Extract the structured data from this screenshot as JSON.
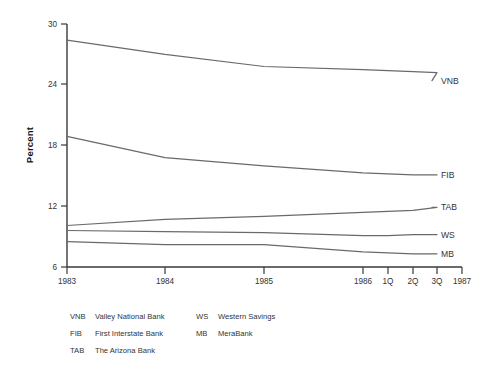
{
  "chart_data": {
    "type": "line",
    "title": "",
    "xlabel": "",
    "ylabel": "Percent",
    "ylim": [
      6,
      30
    ],
    "yticks": [
      6,
      12,
      18,
      24,
      30
    ],
    "ytick_labels": [
      "6",
      "12",
      "18",
      "24",
      "30"
    ],
    "xtick_labels": [
      "1983",
      "1984",
      "1985",
      "1986",
      "1Q",
      "2Q",
      "3Q",
      "1987"
    ],
    "x": [
      "1983",
      "1984",
      "1985",
      "1986",
      "1Q",
      "2Q",
      "3Q"
    ],
    "grid": false,
    "legend_position": "right-of-axes-endpoint",
    "series": [
      {
        "name": "VNB",
        "label": "VNB",
        "full_name": "Valley National Bank",
        "values": [
          28.4,
          27.0,
          25.8,
          25.5,
          25.4,
          25.3,
          25.2
        ],
        "end_value": 24.4,
        "color": "#6a6a6a"
      },
      {
        "name": "FIB",
        "label": "FIB",
        "full_name": "First Interstate Bank",
        "values": [
          18.9,
          16.8,
          16.0,
          15.3,
          15.2,
          15.1,
          15.1
        ],
        "end_value": 15.1,
        "color": "#6a6a6a"
      },
      {
        "name": "TAB",
        "label": "TAB",
        "full_name": "The Arizona Bank",
        "values": [
          10.1,
          10.7,
          11.0,
          11.4,
          11.5,
          11.6,
          11.9
        ],
        "end_value": 11.9,
        "color": "#6a6a6a"
      },
      {
        "name": "WS",
        "label": "WS",
        "full_name": "Western Savings",
        "values": [
          9.6,
          9.5,
          9.4,
          9.1,
          9.1,
          9.2,
          9.2
        ],
        "end_value": 9.2,
        "color": "#6a6a6a"
      },
      {
        "name": "MB",
        "label": "MB",
        "full_name": "MeraBank",
        "values": [
          8.5,
          8.2,
          8.2,
          7.5,
          7.4,
          7.3,
          7.3
        ],
        "end_value": 7.3,
        "color": "#6a6a6a"
      }
    ]
  },
  "axes": {
    "y_label": "Percent",
    "y_ticks": [
      {
        "value": 30,
        "label": "30"
      },
      {
        "value": 24,
        "label": "24"
      },
      {
        "value": 18,
        "label": "18"
      },
      {
        "value": 12,
        "label": "12"
      },
      {
        "value": 6,
        "label": "6"
      }
    ],
    "x_ticks": [
      {
        "key": "1983",
        "label": "1983"
      },
      {
        "key": "1984",
        "label": "1984"
      },
      {
        "key": "1985",
        "label": "1985"
      },
      {
        "key": "1986",
        "label": "1986"
      },
      {
        "key": "1Q",
        "label": "1Q"
      },
      {
        "key": "2Q",
        "label": "2Q"
      },
      {
        "key": "3Q",
        "label": "3Q"
      },
      {
        "key": "1987",
        "label": "1987"
      }
    ]
  },
  "series_labels": {
    "vnb": "VNB",
    "fib": "FIB",
    "tab": "TAB",
    "ws": "WS",
    "mb": "MB"
  },
  "legend": {
    "column_1": [
      {
        "abbr": "VNB",
        "name": "Valley National Bank"
      },
      {
        "abbr": "FIB",
        "name": "First Interstate Bank"
      },
      {
        "abbr": "TAB",
        "name": "The Arizona Bank"
      }
    ],
    "column_2": [
      {
        "abbr": "WS",
        "name": "Western Savings"
      },
      {
        "abbr": "MB",
        "name": "MeraBank"
      }
    ]
  },
  "colors": {
    "line": "#6a6a6a",
    "axis": "#3a3a3a",
    "text": "#333333",
    "background": "#ffffff"
  }
}
